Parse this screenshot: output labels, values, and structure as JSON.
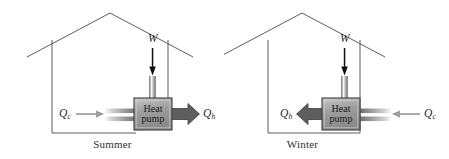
{
  "figure": {
    "kind": "physics-diagram"
  },
  "colors": {
    "outline": "#4a4a4a",
    "box_fill": "#9a9a9a",
    "box_border": "#3d3d3d",
    "hot_arrow": "#5a5a5a",
    "cold_arrow": "#9d9d9d",
    "work_arrow": "#111111",
    "pipe": "#8e8e8e",
    "text": "#2b2b2b"
  },
  "panels": [
    {
      "id": "summer",
      "caption": "Summer",
      "box_label_line1": "Heat",
      "box_label_line2": "pump",
      "work": {
        "label": "W",
        "direction": "down"
      },
      "cold": {
        "label": "Q",
        "subscript": "c",
        "direction": "right",
        "side": "left",
        "role": "heat-absorbed-inside"
      },
      "hot": {
        "label": "Q",
        "subscript": "h",
        "direction": "right",
        "side": "right",
        "role": "heat-rejected-outside"
      }
    },
    {
      "id": "winter",
      "caption": "Winter",
      "box_label_line1": "Heat",
      "box_label_line2": "pump",
      "work": {
        "label": "W",
        "direction": "down"
      },
      "cold": {
        "label": "Q",
        "subscript": "c",
        "direction": "left",
        "side": "right",
        "role": "heat-absorbed-outside"
      },
      "hot": {
        "label": "Q",
        "subscript": "h",
        "direction": "left",
        "side": "left",
        "role": "heat-delivered-inside"
      }
    }
  ]
}
